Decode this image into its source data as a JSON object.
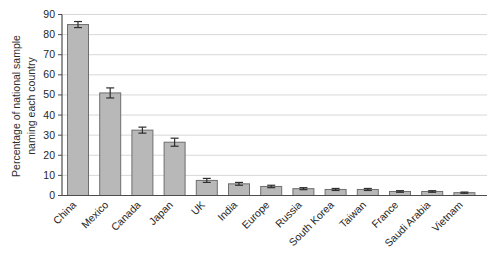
{
  "chart_data": {
    "type": "bar",
    "title": "",
    "ylabel_lines": [
      "Percentage of national sample",
      "naming each country"
    ],
    "xlabel": "",
    "categories": [
      "China",
      "Mexico",
      "Canada",
      "Japan",
      "UK",
      "India",
      "Europe",
      "Russia",
      "South Korea",
      "Taiwan",
      "France",
      "Saudi Arabia",
      "Vietnam"
    ],
    "values": [
      85,
      51,
      32.5,
      26.5,
      7.5,
      5.8,
      4.5,
      3.4,
      3,
      3,
      2,
      2,
      1.4
    ],
    "errors": [
      1.5,
      2.5,
      1.5,
      2,
      1,
      0.7,
      0.6,
      0.5,
      0.5,
      0.5,
      0.4,
      0.4,
      0.3
    ],
    "error_bars": true,
    "ylim": [
      0,
      90
    ],
    "yticks": [
      0,
      10,
      20,
      30,
      40,
      50,
      60,
      70,
      80,
      90
    ],
    "grid": "horizontal",
    "legend": "none",
    "x_label_rotation_deg": 45,
    "colors": {
      "background": "#ffffff",
      "bar_fill": "#b8b8b8",
      "bar_border": "#6e6e6e",
      "grid": "#d8d8d8",
      "axis": "#4d4d4d",
      "error": "#2e2e2e",
      "text": "#262626"
    }
  }
}
